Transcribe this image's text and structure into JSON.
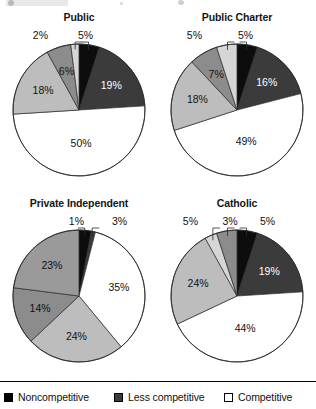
{
  "top_strip": {
    "visible": true,
    "note": ""
  },
  "legend": {
    "items": [
      {
        "label": "Noncompetitive",
        "color": "#000000",
        "border": "#000000"
      },
      {
        "label": "Less competitive",
        "color": "#3b3b3b",
        "border": "#000000"
      },
      {
        "label": "Competitive",
        "color": "#ffffff",
        "border": "#000000"
      }
    ]
  },
  "chart_data": [
    {
      "type": "pie",
      "title": "Public",
      "categories": [
        "Noncompetitive",
        "Less competitive",
        "Competitive",
        "Slice 4",
        "Slice 5",
        "Slice 6"
      ],
      "values": [
        5,
        19,
        50,
        18,
        6,
        2
      ],
      "labels": [
        "5%",
        "19%",
        "50%",
        "18%",
        "6%",
        "2%"
      ],
      "colors": [
        "#0d0d0d",
        "#3b3b3b",
        "#ffffff",
        "#bdbdbd",
        "#8c8c8c",
        "#d6d6d6"
      ],
      "label_colors": [
        "#111111",
        "#ffffff",
        "#111111",
        "#111111",
        "#111111",
        "#111111"
      ],
      "leader_labels": [
        "5%",
        "2%"
      ],
      "start_angle": 0,
      "direction": "clockwise"
    },
    {
      "type": "pie",
      "title": "Public Charter",
      "categories": [
        "Noncompetitive",
        "Less competitive",
        "Competitive",
        "Slice 4",
        "Slice 5",
        "Slice 6"
      ],
      "values": [
        5,
        16,
        49,
        18,
        7,
        5
      ],
      "labels": [
        "5%",
        "16%",
        "49%",
        "18%",
        "7%",
        "5%"
      ],
      "colors": [
        "#0d0d0d",
        "#3b3b3b",
        "#ffffff",
        "#bdbdbd",
        "#8c8c8c",
        "#d6d6d6"
      ],
      "label_colors": [
        "#111111",
        "#ffffff",
        "#111111",
        "#111111",
        "#111111",
        "#111111"
      ],
      "leader_labels": [
        "5%",
        "5%"
      ],
      "start_angle": 0,
      "direction": "clockwise"
    },
    {
      "type": "pie",
      "title": "Private Independent",
      "categories": [
        "Noncompetitive",
        "Less competitive",
        "Competitive",
        "Slice 4",
        "Slice 5",
        "Slice 6"
      ],
      "values": [
        3,
        1,
        35,
        24,
        14,
        23
      ],
      "labels": [
        "3%",
        "1%",
        "35%",
        "24%",
        "14%",
        "23%"
      ],
      "colors": [
        "#0d0d0d",
        "#3b3b3b",
        "#ffffff",
        "#bdbdbd",
        "#8c8c8c",
        "#9a9a9a"
      ],
      "label_colors": [
        "#111111",
        "#111111",
        "#111111",
        "#111111",
        "#111111",
        "#111111"
      ],
      "leader_labels": [
        "1%",
        "3%"
      ],
      "start_angle": 0,
      "direction": "clockwise"
    },
    {
      "type": "pie",
      "title": "Catholic",
      "categories": [
        "Noncompetitive",
        "Less competitive",
        "Competitive",
        "Slice 4",
        "Slice 5",
        "Slice 6"
      ],
      "values": [
        5,
        19,
        44,
        24,
        3,
        5
      ],
      "labels": [
        "5%",
        "19%",
        "44%",
        "24%",
        "3%",
        "5%"
      ],
      "colors": [
        "#0d0d0d",
        "#3b3b3b",
        "#ffffff",
        "#bdbdbd",
        "#d6d6d6",
        "#8c8c8c"
      ],
      "label_colors": [
        "#111111",
        "#ffffff",
        "#111111",
        "#111111",
        "#111111",
        "#111111"
      ],
      "leader_labels": [
        "5%",
        "3%",
        "5%"
      ],
      "start_angle": 0,
      "direction": "clockwise"
    }
  ]
}
